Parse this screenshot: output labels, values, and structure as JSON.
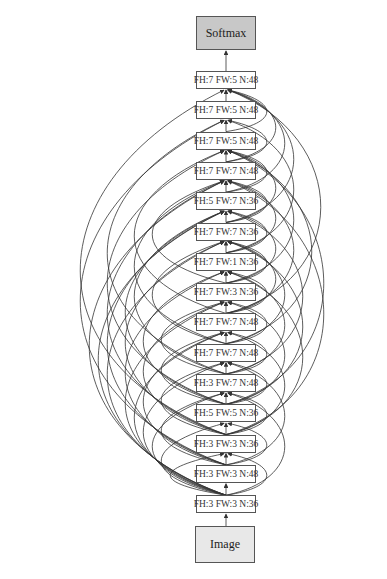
{
  "diagram": {
    "type": "neural-architecture-graph",
    "output_node": {
      "label": "Softmax",
      "fill": "#c8c8c8",
      "box": [
        196,
        16,
        60,
        34
      ]
    },
    "input_node": {
      "label": "Image",
      "fill": "#e8e8e8",
      "box": [
        195,
        526,
        60,
        37
      ]
    },
    "layer_box": {
      "x": 196,
      "width": 60,
      "height": 18,
      "top_first": 71,
      "spacing": 30.3
    },
    "layers": [
      {
        "index": 14,
        "label": "FH:7 FW:5 N:48"
      },
      {
        "index": 13,
        "label": "FH:7 FW:5 N:48"
      },
      {
        "index": 12,
        "label": "FH:7 FW:5 N:48"
      },
      {
        "index": 11,
        "label": "FH:7 FW:7 N:48"
      },
      {
        "index": 10,
        "label": "FH:5 FW:7 N:36"
      },
      {
        "index": 9,
        "label": "FH:7 FW:7 N:36"
      },
      {
        "index": 8,
        "label": "FH:7 FW:1 N:36"
      },
      {
        "index": 7,
        "label": "FH:7 FW:3 N:36"
      },
      {
        "index": 6,
        "label": "FH:7 FW:7 N:48"
      },
      {
        "index": 5,
        "label": "FH:7 FW:7 N:48"
      },
      {
        "index": 4,
        "label": "FH:3 FW:7 N:48"
      },
      {
        "index": 3,
        "label": "FH:5 FW:5 N:36"
      },
      {
        "index": 2,
        "label": "FH:3 FW:3 N:36"
      },
      {
        "index": 1,
        "label": "FH:3 FW:3 N:48"
      },
      {
        "index": 0,
        "label": "FH:3 FW:3 N:36"
      }
    ],
    "skip_connections": {
      "left": [
        [
          0,
          2
        ],
        [
          0,
          3
        ],
        [
          0,
          4
        ],
        [
          0,
          5
        ],
        [
          0,
          6
        ],
        [
          0,
          7
        ],
        [
          0,
          9
        ],
        [
          0,
          10
        ],
        [
          0,
          11
        ],
        [
          1,
          4
        ],
        [
          1,
          6
        ],
        [
          1,
          8
        ],
        [
          1,
          10
        ],
        [
          1,
          13
        ],
        [
          2,
          5
        ],
        [
          2,
          7
        ],
        [
          2,
          9
        ],
        [
          2,
          11
        ],
        [
          2,
          14
        ],
        [
          3,
          6
        ],
        [
          3,
          8
        ],
        [
          3,
          10
        ],
        [
          3,
          12
        ],
        [
          4,
          7
        ],
        [
          4,
          10
        ],
        [
          4,
          13
        ],
        [
          5,
          9
        ],
        [
          5,
          11
        ],
        [
          6,
          12
        ],
        [
          7,
          11
        ]
      ],
      "right": [
        [
          0,
          2
        ],
        [
          0,
          4
        ],
        [
          1,
          3
        ],
        [
          1,
          5
        ],
        [
          2,
          4
        ],
        [
          2,
          6
        ],
        [
          2,
          8
        ],
        [
          3,
          5
        ],
        [
          3,
          7
        ],
        [
          3,
          9
        ],
        [
          4,
          6
        ],
        [
          4,
          8
        ],
        [
          4,
          10
        ],
        [
          5,
          7
        ],
        [
          5,
          9
        ],
        [
          5,
          12
        ],
        [
          6,
          8
        ],
        [
          6,
          9
        ],
        [
          6,
          11
        ],
        [
          7,
          9
        ],
        [
          7,
          10
        ],
        [
          7,
          12
        ],
        [
          8,
          10
        ],
        [
          8,
          11
        ],
        [
          8,
          13
        ],
        [
          9,
          11
        ],
        [
          9,
          12
        ],
        [
          9,
          14
        ],
        [
          10,
          12
        ],
        [
          10,
          14
        ],
        [
          11,
          13
        ],
        [
          11,
          14
        ],
        [
          12,
          14
        ],
        [
          6,
          14
        ],
        [
          3,
          12
        ],
        [
          2,
          11
        ]
      ]
    },
    "edge_color": "#333333"
  }
}
